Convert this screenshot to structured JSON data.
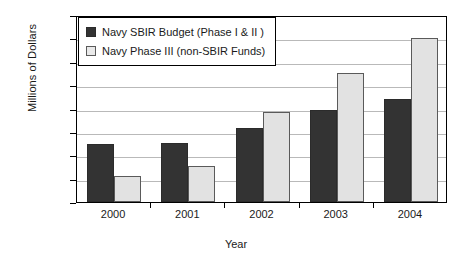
{
  "chart_data": {
    "type": "bar",
    "title": "",
    "xlabel": "Year",
    "ylabel": "Millions of Dollars",
    "categories": [
      "2000",
      "2001",
      "2002",
      "2003",
      "2004"
    ],
    "series": [
      {
        "name": "Navy SBIR Budget (Phase I & II )",
        "color": "#333333",
        "values": [
          124,
          127,
          158,
          197,
          220
        ]
      },
      {
        "name": "Navy Phase III (non-SBIR Funds)",
        "color": "#e2e2e2",
        "values": [
          55,
          78,
          192,
          277,
          350
        ]
      }
    ],
    "ylim": [
      0,
      400
    ],
    "ytick_step": 50,
    "yticks": [
      "400",
      "350",
      "300",
      "250",
      "200",
      "150",
      "100",
      "50",
      "0"
    ],
    "grid": true,
    "legend_position": "top-left"
  }
}
